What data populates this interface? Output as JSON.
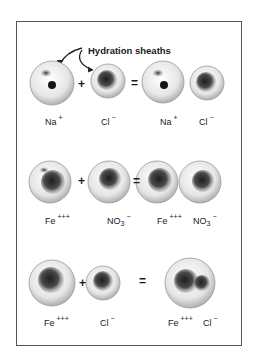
{
  "caption": "Hydration sheaths",
  "colors": {
    "frame": "#555555",
    "ion_core": "#222222",
    "sheath_shade": "#c8c8c8"
  },
  "rows": [
    {
      "reactants": [
        {
          "symbol": "Na",
          "charge": "+",
          "subscript": ""
        },
        {
          "symbol": "Cl",
          "charge": "−",
          "subscript": ""
        }
      ],
      "products": [
        {
          "symbol": "Na",
          "charge": "+",
          "subscript": ""
        },
        {
          "symbol": "Cl",
          "charge": "−",
          "subscript": ""
        }
      ],
      "plus": "+",
      "equals": "="
    },
    {
      "reactants": [
        {
          "symbol": "Fe",
          "charge": "+++",
          "subscript": ""
        },
        {
          "symbol": "NO",
          "charge": "−",
          "subscript": "3"
        }
      ],
      "products": [
        {
          "symbol": "Fe",
          "charge": "+++",
          "subscript": ""
        },
        {
          "symbol": "NO",
          "charge": "−",
          "subscript": "3"
        }
      ],
      "plus": "+",
      "equals": "="
    },
    {
      "reactants": [
        {
          "symbol": "Fe",
          "charge": "+++",
          "subscript": ""
        },
        {
          "symbol": "Cl",
          "charge": "−",
          "subscript": ""
        }
      ],
      "products": [
        {
          "symbol": "Fe",
          "charge": "+++",
          "subscript": ""
        },
        {
          "symbol": "Cl",
          "charge": "−",
          "subscript": ""
        }
      ],
      "plus": "+",
      "equals": "="
    }
  ]
}
